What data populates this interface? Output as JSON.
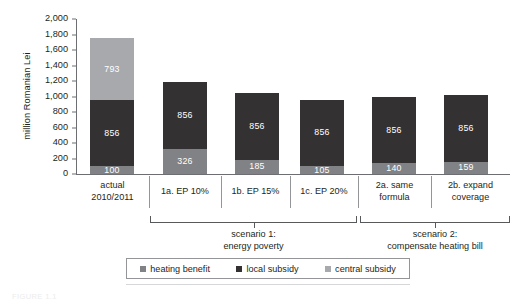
{
  "figure": {
    "caption": "FIGURE 1.1"
  },
  "chart_data": {
    "type": "bar",
    "subtype": "stacked-bar",
    "title": "",
    "xlabel": "",
    "ylabel": "million Romanian Lei",
    "ylim": [
      0,
      2000
    ],
    "ytick_labels": [
      "0",
      "200",
      "400",
      "600",
      "800",
      "1,000",
      "1,200",
      "1,400",
      "1,600",
      "1,800",
      "2,000"
    ],
    "ytick_values": [
      0,
      200,
      400,
      600,
      800,
      1000,
      1200,
      1400,
      1600,
      1800,
      2000
    ],
    "grid": false,
    "legend_position": "bottom",
    "categories": [
      "actual\n2010/2011",
      "1a. EP 10%",
      "1b. EP 15%",
      "1c. EP 20%",
      "2a. same\nformula",
      "2b. expand\ncoverage"
    ],
    "category_lines": [
      [
        "actual",
        "2010/2011"
      ],
      [
        "1a. EP 10%"
      ],
      [
        "1b. EP 15%"
      ],
      [
        "1c. EP 20%"
      ],
      [
        "2a. same",
        "formula"
      ],
      [
        "2b. expand",
        "coverage"
      ]
    ],
    "series": [
      {
        "name": "heating benefit",
        "color": "#808285",
        "values": [
          100,
          326,
          185,
          105,
          140,
          159
        ],
        "labels": [
          "100",
          "326",
          "185",
          "105",
          "140",
          "159"
        ]
      },
      {
        "name": "local subsidy",
        "color": "#333132",
        "values": [
          856,
          856,
          856,
          856,
          856,
          856
        ],
        "labels": [
          "856",
          "856",
          "856",
          "856",
          "856",
          "856"
        ]
      },
      {
        "name": "central subsidy",
        "color": "#a7a9ac",
        "values": [
          793,
          0,
          0,
          0,
          0,
          0
        ],
        "labels": [
          "793",
          "",
          "",
          "",
          "",
          ""
        ]
      }
    ],
    "totals": [
      1749,
      1182,
      1041,
      961,
      996,
      1015
    ],
    "groups": [
      {
        "label_lines": [
          "scenario 1:",
          "energy poverty"
        ],
        "categories": [
          "1a. EP 10%",
          "1b. EP 15%",
          "1c. EP 20%"
        ]
      },
      {
        "label_lines": [
          "scenario 2:",
          "compensate heating bill"
        ],
        "categories": [
          "2a. same formula",
          "2b. expand coverage"
        ]
      }
    ],
    "legend": [
      {
        "label": "heating benefit",
        "color": "#808285",
        "swatch": "legend-swatch-heating"
      },
      {
        "label": "local subsidy",
        "color": "#333132",
        "swatch": "legend-swatch-local"
      },
      {
        "label": "central subsidy",
        "color": "#a7a9ac",
        "swatch": "legend-swatch-central"
      }
    ]
  }
}
